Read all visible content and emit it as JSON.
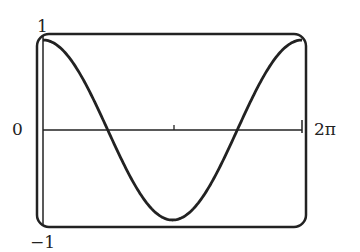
{
  "chart_data": {
    "type": "line",
    "title": "",
    "xlabel": "",
    "ylabel": "",
    "function": "cos(x)",
    "x": [
      0,
      0.785,
      1.571,
      2.356,
      3.142,
      3.927,
      4.712,
      5.498,
      6.283
    ],
    "values": [
      1,
      0.707,
      0,
      -0.707,
      -1,
      -0.707,
      0,
      0.707,
      1
    ],
    "xlim": [
      0,
      6.283
    ],
    "ylim": [
      -1,
      1
    ],
    "x_tick_labels": [
      "0",
      "2π"
    ],
    "y_tick_labels": [
      "1",
      "-1"
    ],
    "grid": false,
    "legend": null
  },
  "labels": {
    "y_top": "1",
    "y_bottom": "−1",
    "x_origin": "0",
    "x_end": "2π"
  },
  "colors": {
    "stroke": "#222222",
    "background": "#ffffff"
  }
}
